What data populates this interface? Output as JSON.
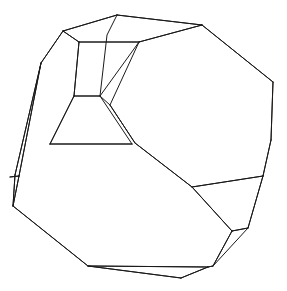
{
  "figure": {
    "caption": "",
    "background_color": "#ffffff",
    "line_color": "#1a1a1a",
    "line_width": 1,
    "canvas": {
      "width": 287,
      "height": 291
    }
  },
  "chart_data": {
    "type": "diagram",
    "title": "",
    "vertices": {
      "top_apex": [
        117,
        15
      ],
      "top_left_shoulder": [
        63,
        31
      ],
      "upper_left_ridge": [
        41,
        63
      ],
      "top_right_shoulder": [
        202,
        25
      ],
      "right_upper": [
        273,
        82
      ],
      "right_mid": [
        271,
        140
      ],
      "right_lower_junction": [
        263,
        176
      ],
      "left_edge_mid": [
        15,
        175
      ],
      "left_tip": [
        13,
        206
      ],
      "bottom_left_bend": [
        88,
        266
      ],
      "bottom_right_end": [
        208,
        267
      ],
      "bottom_dip": [
        181,
        278
      ],
      "lower_right_facet_top_left": [
        232,
        231
      ],
      "lower_right_facet_top_right": [
        248,
        228
      ],
      "lower_right_facet_bottom": [
        213,
        266
      ],
      "inner_upper_small_left": [
        74,
        96
      ],
      "inner_upper_small_right": [
        100,
        96
      ],
      "inner_mid_left": [
        50,
        144
      ],
      "inner_mid_right": [
        132,
        144
      ],
      "inner_ridge_top": [
        110,
        105
      ],
      "inner_mid_junction": [
        135,
        143
      ],
      "inner_lower_junction": [
        192,
        187
      ],
      "sliver_left_cross_a": [
        10,
        177
      ],
      "sliver_left_cross_b": [
        19,
        176
      ],
      "neck_left": [
        79,
        42
      ],
      "neck_right": [
        139,
        42
      ]
    },
    "edges": [
      [
        "top_apex",
        "top_left_shoulder"
      ],
      [
        "top_apex",
        "top_right_shoulder"
      ],
      [
        "top_left_shoulder",
        "upper_left_ridge"
      ],
      [
        "upper_left_ridge",
        "left_edge_mid"
      ],
      [
        "left_edge_mid",
        "left_tip"
      ],
      [
        "left_tip",
        "bottom_left_bend"
      ],
      [
        "bottom_left_bend",
        "bottom_right_end"
      ],
      [
        "bottom_left_bend",
        "bottom_dip"
      ],
      [
        "bottom_dip",
        "bottom_right_end"
      ],
      [
        "bottom_right_end",
        "lower_right_facet_bottom"
      ],
      [
        "lower_right_facet_bottom",
        "lower_right_facet_top_left"
      ],
      [
        "lower_right_facet_top_left",
        "lower_right_facet_top_right"
      ],
      [
        "lower_right_facet_top_right",
        "right_lower_junction"
      ],
      [
        "right_lower_junction",
        "right_mid"
      ],
      [
        "right_mid",
        "right_upper"
      ],
      [
        "right_upper",
        "top_right_shoulder"
      ],
      [
        "top_right_shoulder",
        "neck_right"
      ],
      [
        "neck_right",
        "neck_left"
      ],
      [
        "neck_left",
        "top_left_shoulder"
      ],
      [
        "neck_left",
        "inner_upper_small_left"
      ],
      [
        "neck_right",
        "inner_upper_small_right"
      ],
      [
        "inner_upper_small_left",
        "inner_upper_small_right"
      ],
      [
        "inner_upper_small_left",
        "inner_mid_left"
      ],
      [
        "inner_upper_small_right",
        "inner_ridge_top"
      ],
      [
        "inner_mid_left",
        "inner_mid_right"
      ],
      [
        "inner_ridge_top",
        "inner_mid_junction"
      ],
      [
        "inner_mid_junction",
        "inner_lower_junction"
      ],
      [
        "inner_lower_junction",
        "lower_right_facet_top_left"
      ],
      [
        "inner_lower_junction",
        "right_lower_junction"
      ],
      [
        "upper_left_ridge",
        "sliver_left_cross_b"
      ],
      [
        "sliver_left_cross_a",
        "sliver_left_cross_b"
      ],
      [
        "sliver_left_cross_b",
        "left_tip"
      ]
    ],
    "face_count_visible": 12,
    "xlabel": "",
    "ylabel": "",
    "grid": false,
    "legend": "none"
  }
}
